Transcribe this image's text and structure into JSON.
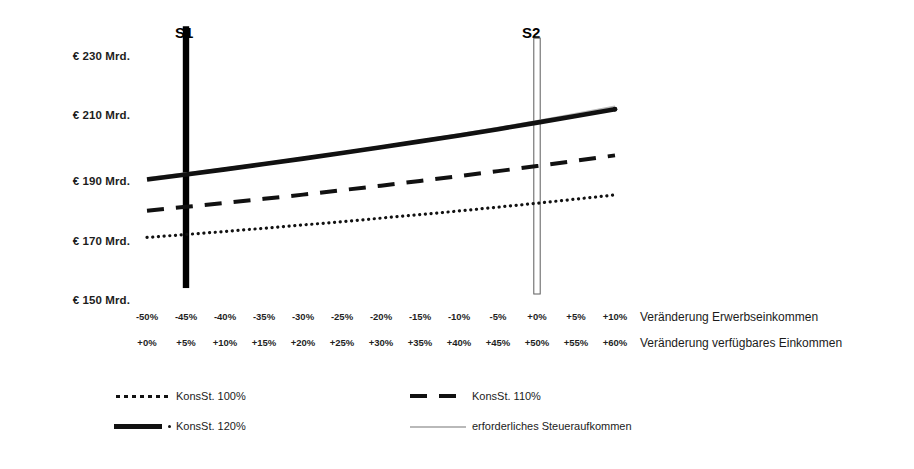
{
  "chart_data": {
    "type": "line",
    "title": "",
    "xlabel_rows": [
      "Veränderung Erwerbseinkommen",
      "Veränderung verfügbares Einkommen"
    ],
    "ylabel": "",
    "ylim": [
      150,
      240
    ],
    "yticks": [
      230,
      210,
      190,
      170,
      150
    ],
    "ytick_labels": [
      "€ 230 Mrd.",
      "€ 210 Mrd.",
      "€ 190 Mrd.",
      "€ 170 Mrd.",
      "€ 150 Mrd."
    ],
    "grid": false,
    "x": [
      -50,
      -45,
      -40,
      -35,
      -30,
      -25,
      -20,
      -15,
      -10,
      -5,
      0,
      5,
      10
    ],
    "xtick_labels_row1": [
      "-50%",
      "-45%",
      "-40%",
      "-35%",
      "-30%",
      "-25%",
      "-20%",
      "-15%",
      "-10%",
      "-5%",
      "+0%",
      "+5%",
      "+10%"
    ],
    "xtick_labels_row2": [
      "+0%",
      "+5%",
      "+10%",
      "+15%",
      "+20%",
      "+25%",
      "+30%",
      "+35%",
      "+40%",
      "+45%",
      "+50%",
      "+55%",
      "+60%"
    ],
    "series": [
      {
        "name": "KonsSt. 100%",
        "style": "dotted",
        "color": "#111111",
        "values": [
          169.0,
          170.0,
          171.0,
          172.1,
          173.2,
          174.3,
          175.5,
          176.7,
          177.9,
          179.2,
          180.5,
          181.9,
          183.3
        ]
      },
      {
        "name": "KonsSt. 110%",
        "style": "dashed",
        "color": "#111111",
        "values": [
          178.0,
          179.3,
          180.6,
          182.0,
          183.4,
          184.9,
          186.4,
          188.0,
          189.6,
          191.3,
          193.0,
          194.8,
          196.6
        ]
      },
      {
        "name": "KonsSt. 120%",
        "style": "solid",
        "color": "#111111",
        "values": [
          188.5,
          190.2,
          191.9,
          193.7,
          195.5,
          197.4,
          199.3,
          201.3,
          203.3,
          205.4,
          207.6,
          209.8,
          212.1
        ]
      },
      {
        "name": "erforderliches Steueraufkommen",
        "style": "thin-gray",
        "color": "#b9b9b9",
        "values": [
          189.0,
          190.6,
          192.3,
          194.0,
          195.8,
          197.7,
          199.6,
          201.6,
          203.7,
          205.9,
          208.2,
          210.6,
          213.1
        ]
      }
    ],
    "markers": [
      {
        "label": "S1",
        "x": -45,
        "style": "filled",
        "color": "#000000",
        "y_top": 240,
        "y_bottom": 152
      },
      {
        "label": "S2",
        "x": 0,
        "style": "hollow",
        "color": "#000000",
        "y_top": 236,
        "y_bottom": 150
      }
    ],
    "legend": {
      "position": "bottom",
      "entries": [
        {
          "label": "KonsSt. 100%",
          "key": "dotted"
        },
        {
          "label": "KonsSt. 110%",
          "key": "dashed"
        },
        {
          "label": "KonsSt. 120%",
          "key": "solid"
        },
        {
          "label": "erforderliches Steueraufkommen",
          "key": "thin-gray"
        }
      ]
    }
  }
}
